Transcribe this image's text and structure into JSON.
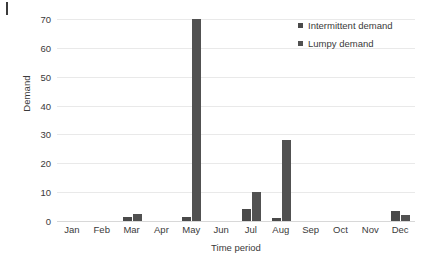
{
  "chart_data": {
    "type": "bar",
    "title": "",
    "xlabel": "Time period",
    "ylabel": "Demand",
    "categories": [
      "Jan",
      "Feb",
      "Mar",
      "Apr",
      "May",
      "Jun",
      "Jul",
      "Aug",
      "Sep",
      "Oct",
      "Nov",
      "Dec"
    ],
    "series": [
      {
        "name": "Intermittent demand",
        "color": "#4a4a4a",
        "values": [
          0,
          0,
          1.5,
          0,
          1.5,
          0,
          4,
          1,
          0,
          0,
          0,
          3.5
        ]
      },
      {
        "name": "Lumpy demand",
        "color": "#515151",
        "values": [
          0,
          0,
          2.5,
          0,
          70,
          0,
          10,
          28,
          0,
          0,
          0,
          2
        ]
      }
    ],
    "ylim": [
      0,
      70
    ],
    "y_ticks": [
      0,
      10,
      20,
      30,
      40,
      50,
      60,
      70
    ],
    "y_tick_labels": [
      "0",
      "10",
      "20",
      "30",
      "40",
      "50",
      "60",
      "70"
    ],
    "grid": true,
    "grid_color": "#e9e9e9",
    "legend_position": "top-right",
    "background": "#ffffff"
  },
  "legend": {
    "items": [
      {
        "label": "Intermittent demand",
        "swatch": "#4a4a4a"
      },
      {
        "label": "Lumpy demand",
        "swatch": "#515151"
      }
    ]
  }
}
